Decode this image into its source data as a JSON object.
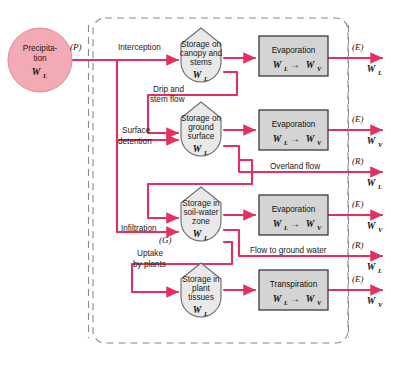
{
  "diagram": {
    "colors": {
      "flow_line": "#e5305f",
      "precip_fill": "#f2aab4",
      "precip_stroke": "#d98f9b",
      "storage_fill": "#e9e9e9",
      "storage_stroke": "#6b6b6b",
      "process_fill": "#d4d4d4",
      "process_stroke": "#3a3a3a",
      "boundary": "#8a8a8a",
      "text": "#1a1a1a"
    },
    "source": {
      "name": "precipitation",
      "line1": "Precipita-",
      "line2": "tion",
      "symbol": "W",
      "symbol_sub": "L",
      "flux_tag": "(P)"
    },
    "storages": [
      {
        "id": "canopy",
        "lines": [
          "Storage on",
          "canopy and",
          "stems"
        ],
        "symbol": "W",
        "symbol_sub": "L"
      },
      {
        "id": "ground-surface",
        "lines": [
          "Storage on",
          "ground",
          "surface"
        ],
        "symbol": "W",
        "symbol_sub": "L"
      },
      {
        "id": "soil-water-zone",
        "lines": [
          "Storage in",
          "soil-water",
          "zone"
        ],
        "symbol": "W",
        "symbol_sub": "L"
      },
      {
        "id": "plant-tissues",
        "lines": [
          "Storage in",
          "plant",
          "tissues"
        ],
        "symbol": "W",
        "symbol_sub": "L"
      }
    ],
    "processes": [
      {
        "id": "evaporation-canopy",
        "label": "Evaporation",
        "from": "W",
        "from_sub": "L",
        "to": "W",
        "to_sub": "V"
      },
      {
        "id": "evaporation-ground",
        "label": "Evaporation",
        "from": "W",
        "from_sub": "L",
        "to": "W",
        "to_sub": "V"
      },
      {
        "id": "evaporation-soil",
        "label": "Evaporation",
        "from": "W",
        "from_sub": "L",
        "to": "W",
        "to_sub": "V"
      },
      {
        "id": "transpiration-plant",
        "label": "Transpiration",
        "from": "W",
        "from_sub": "L",
        "to": "W",
        "to_sub": "V"
      }
    ],
    "transfer_labels": [
      {
        "id": "interception",
        "text": "Interception"
      },
      {
        "id": "drip-and-stem-flow",
        "line1": "Drip and",
        "line2": "stem flow"
      },
      {
        "id": "surface-detention",
        "line1": "Surface",
        "line2": "detention"
      },
      {
        "id": "overland-flow",
        "text": "Overland flow"
      },
      {
        "id": "infiltration",
        "text": "Infiltration"
      },
      {
        "id": "groundwater-tag",
        "text": "(G)"
      },
      {
        "id": "uptake-by-plants",
        "line1": "Uptake",
        "line2": "by plants"
      },
      {
        "id": "flow-to-ground-water",
        "text": "Flow to ground water"
      }
    ],
    "outputs": [
      {
        "id": "output-1",
        "flux_tag": "(E)",
        "symbol": "W",
        "symbol_sub": "L"
      },
      {
        "id": "output-2",
        "flux_tag": "(E)",
        "symbol": "W",
        "symbol_sub": "V"
      },
      {
        "id": "output-3",
        "flux_tag": "(R)",
        "symbol": "W",
        "symbol_sub": "L"
      },
      {
        "id": "output-4",
        "flux_tag": "(E)",
        "symbol": "W",
        "symbol_sub": "V"
      },
      {
        "id": "output-5",
        "flux_tag": "(R)",
        "symbol": "W",
        "symbol_sub": "L"
      },
      {
        "id": "output-6",
        "flux_tag": "(E)",
        "symbol": "W",
        "symbol_sub": "V"
      }
    ]
  }
}
